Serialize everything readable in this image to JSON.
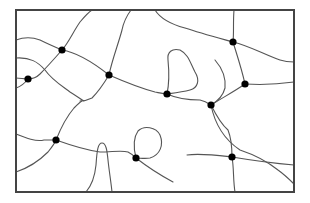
{
  "diagram": {
    "type": "network-graph",
    "frame": {
      "x": 16,
      "y": 10,
      "width": 278,
      "height": 182
    },
    "colors": {
      "edge": "#555555",
      "node": "#000000",
      "frame": "#444444",
      "background": "#ffffff"
    },
    "node_radius": 3.6,
    "nodes": [
      {
        "id": "n1",
        "x": 62,
        "y": 50
      },
      {
        "id": "n2",
        "x": 28,
        "y": 79
      },
      {
        "id": "n3",
        "x": 109,
        "y": 75
      },
      {
        "id": "n4",
        "x": 233,
        "y": 42
      },
      {
        "id": "n5",
        "x": 245,
        "y": 84
      },
      {
        "id": "n6",
        "x": 167,
        "y": 94
      },
      {
        "id": "n7",
        "x": 211,
        "y": 105
      },
      {
        "id": "n8",
        "x": 56,
        "y": 140
      },
      {
        "id": "n9",
        "x": 136,
        "y": 158
      },
      {
        "id": "n10",
        "x": 232,
        "y": 157
      }
    ],
    "edges": [
      {
        "id": "e1",
        "d": "M16,40 C24,37 32,37 40,40 C48,44 55,47 62,50"
      },
      {
        "id": "e2",
        "d": "M62,50 C69,42 73,32 80,22 C85,16 89,12 92,10"
      },
      {
        "id": "e3",
        "d": "M62,50 C75,52 90,60 109,75"
      },
      {
        "id": "e4",
        "d": "M62,50 C55,58 48,66 40,74 C36,78 32,79 28,79"
      },
      {
        "id": "e5",
        "d": "M16,78 C20,78 24,79 28,79"
      },
      {
        "id": "e6",
        "d": "M16,88 C22,86 25,83 28,79"
      },
      {
        "id": "e7",
        "d": "M16,58 C30,57 38,62 45,70 C52,80 62,86 70,92 C78,97 82,100 84,101"
      },
      {
        "id": "e8",
        "d": "M109,75 C112,60 118,45 122,30 C124,20 128,14 131,10"
      },
      {
        "id": "e9",
        "d": "M109,75 C103,85 98,92 92,98 C86,101 82,101 80,101"
      },
      {
        "id": "e10",
        "d": "M109,75 C125,82 140,88 155,92 C160,93 164,94 167,94"
      },
      {
        "id": "e11",
        "d": "M155,10 C160,18 170,24 185,28 C200,33 215,37 233,42"
      },
      {
        "id": "e12",
        "d": "M233,42 C234,32 233,22 234,10"
      },
      {
        "id": "e13",
        "d": "M233,42 C250,46 265,55 280,60 C286,62 290,62 294,62"
      },
      {
        "id": "e14",
        "d": "M233,42 C237,55 242,70 245,84"
      },
      {
        "id": "e15",
        "d": "M245,84 C260,85 280,84 294,82"
      },
      {
        "id": "e16",
        "d": "M245,84 C235,91 222,98 211,105"
      },
      {
        "id": "e17",
        "d": "M167,94 C170,80 169,70 168,60 C167,52 172,48 180,50 C188,54 190,62 195,72 C200,80 198,88 190,90 C182,92 174,93 167,94"
      },
      {
        "id": "e18",
        "d": "M167,94 C178,99 190,100 200,100 C205,101 208,103 211,105"
      },
      {
        "id": "e19",
        "d": "M215,60 C222,68 226,78 225,88 C223,96 218,101 211,105"
      },
      {
        "id": "e20",
        "d": "M211,105 C216,115 222,125 228,130 C232,140 232,150 232,157"
      },
      {
        "id": "e21",
        "d": "M211,105 C215,125 225,140 240,150 C255,155 268,162 278,170 C285,175 290,180 294,184"
      },
      {
        "id": "e22",
        "d": "M16,134 C26,138 36,142 44,140 C50,140 53,140 56,140"
      },
      {
        "id": "e23",
        "d": "M16,172 C28,168 40,160 48,152 C52,147 55,143 56,140"
      },
      {
        "id": "e24",
        "d": "M56,140 C62,125 68,115 74,108 C78,104 80,102 82,101"
      },
      {
        "id": "e25",
        "d": "M56,140 C70,145 85,150 100,152 C112,152 122,150 128,152 C132,154 134,156 136,158"
      },
      {
        "id": "e26",
        "d": "M86,192 C92,185 95,175 96,165 C97,150 98,143 102,143 C106,143 107,150 108,160 C109,170 111,182 112,192"
      },
      {
        "id": "e27",
        "d": "M136,158 C134,150 133,138 138,131 C144,125 156,127 160,135 C164,145 160,155 150,158 C145,159 140,158 136,158"
      },
      {
        "id": "e28",
        "d": "M136,158 C145,165 160,175 173,182"
      },
      {
        "id": "e29",
        "d": "M187,155 C200,153 215,155 232,157"
      },
      {
        "id": "e30",
        "d": "M232,157 C250,160 270,163 294,165"
      },
      {
        "id": "e31",
        "d": "M232,157 C234,168 233,180 235,192"
      }
    ]
  }
}
